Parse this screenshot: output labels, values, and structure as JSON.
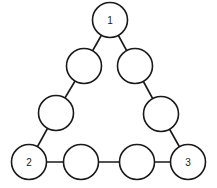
{
  "diagram": {
    "type": "triangle-node-puzzle",
    "colors": {
      "stroke": "#1a1a1a",
      "fill": "#ffffff",
      "background": "#ffffff"
    },
    "radius": 17.5,
    "nodes": [
      {
        "id": "top",
        "label": "1",
        "x": 110,
        "y": 20
      },
      {
        "id": "left-upper",
        "label": "",
        "x": 84,
        "y": 66
      },
      {
        "id": "left-lower",
        "label": "",
        "x": 56,
        "y": 113
      },
      {
        "id": "bottom-left",
        "label": "2",
        "x": 29,
        "y": 162
      },
      {
        "id": "bottom-mid-1",
        "label": "",
        "x": 81,
        "y": 162
      },
      {
        "id": "bottom-mid-2",
        "label": "",
        "x": 137,
        "y": 162
      },
      {
        "id": "bottom-right",
        "label": "3",
        "x": 188,
        "y": 162
      },
      {
        "id": "right-lower",
        "label": "",
        "x": 161,
        "y": 114
      },
      {
        "id": "right-upper",
        "label": "",
        "x": 135,
        "y": 66
      }
    ],
    "edges": [
      [
        "top",
        "left-upper"
      ],
      [
        "left-upper",
        "left-lower"
      ],
      [
        "left-lower",
        "bottom-left"
      ],
      [
        "bottom-left",
        "bottom-mid-1"
      ],
      [
        "bottom-mid-1",
        "bottom-mid-2"
      ],
      [
        "bottom-mid-2",
        "bottom-right"
      ],
      [
        "bottom-right",
        "right-lower"
      ],
      [
        "right-lower",
        "right-upper"
      ],
      [
        "right-upper",
        "top"
      ]
    ]
  }
}
